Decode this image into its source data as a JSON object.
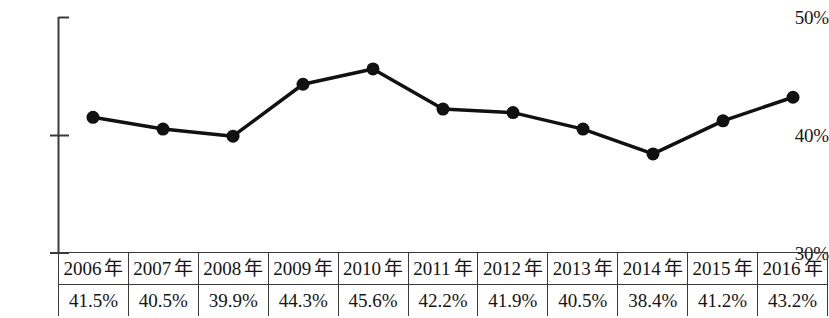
{
  "chart_data": {
    "type": "line",
    "title": "",
    "xlabel": "",
    "ylabel": "",
    "categories": [
      "2006 年",
      "2007 年",
      "2008 年",
      "2009 年",
      "2010 年",
      "2011 年",
      "2012 年",
      "2013 年",
      "2014 年",
      "2015 年",
      "2016 年"
    ],
    "values": [
      41.5,
      40.5,
      39.9,
      44.3,
      45.6,
      42.2,
      41.9,
      40.5,
      38.4,
      41.2,
      43.2
    ],
    "value_labels": [
      "41.5%",
      "40.5%",
      "39.9%",
      "44.3%",
      "45.6%",
      "42.2%",
      "41.9%",
      "40.5%",
      "38.4%",
      "41.2%",
      "43.2%"
    ],
    "ylim": [
      30,
      50
    ],
    "ytick_labels": [
      "50%",
      "40%",
      "30%"
    ],
    "ytick_values": [
      50,
      40,
      30
    ],
    "grid": false,
    "legend": false,
    "series_color": "#111111",
    "marker": "circle"
  },
  "axis": {
    "y_top_label": "50%",
    "y_mid_label": "40%",
    "y_bottom_label": "30%"
  },
  "table": {
    "header_row": [
      "2006 年",
      "2007 年",
      "2008 年",
      "2009 年",
      "2010 年",
      "2011 年",
      "2012 年",
      "2013 年",
      "2014 年",
      "2015 年",
      "2016 年"
    ],
    "value_row": [
      "41.5%",
      "40.5%",
      "39.9%",
      "44.3%",
      "45.6%",
      "42.2%",
      "41.9%",
      "40.5%",
      "38.4%",
      "41.2%",
      "43.2%"
    ]
  }
}
